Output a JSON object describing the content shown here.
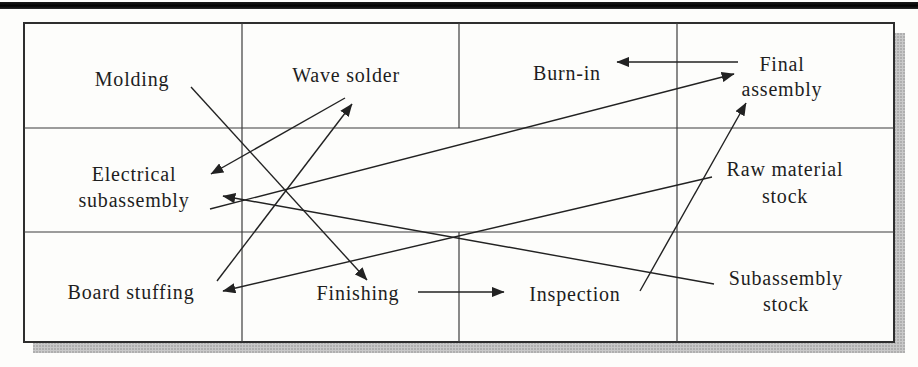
{
  "figure": {
    "kind": "facility-layout-flow-diagram",
    "colors": {
      "ink": "#1e1e1e",
      "grid_line": "#3d3d3d",
      "border": "#2e2e2e",
      "arrow": "#222222",
      "paper": "#fdfdfb",
      "shadow": "#bdbdbd",
      "shadow_dot": "#8e8e8e",
      "top_rule": "#111111"
    },
    "grid": {
      "box": {
        "x": 24,
        "y": 23,
        "w": 870,
        "h": 319
      },
      "h_lines": [
        {
          "y": 128,
          "x1": 24,
          "x2": 894
        },
        {
          "y": 232,
          "x1": 24,
          "x2": 894
        }
      ],
      "v_lines": [
        {
          "x": 242,
          "y1": 23,
          "y2": 342
        },
        {
          "x": 459,
          "y1": 23,
          "y2": 128
        },
        {
          "x": 459,
          "y1": 232,
          "y2": 342
        },
        {
          "x": 677,
          "y1": 23,
          "y2": 342
        }
      ],
      "shadow_rects": [
        {
          "x": 894,
          "y": 33,
          "w": 11,
          "h": 320
        },
        {
          "x": 33,
          "y": 342,
          "w": 872,
          "h": 11
        }
      ]
    },
    "departments": [
      {
        "id": "molding",
        "x": 132,
        "lines": [
          {
            "text": "Molding",
            "y": 86
          }
        ]
      },
      {
        "id": "wave-solder",
        "x": 346,
        "lines": [
          {
            "text": "Wave solder",
            "y": 82
          }
        ]
      },
      {
        "id": "burn-in",
        "x": 567,
        "lines": [
          {
            "text": "Burn-in",
            "y": 80
          }
        ]
      },
      {
        "id": "final-assembly",
        "x": 782,
        "lines": [
          {
            "text": "Final",
            "y": 71
          },
          {
            "text": "assembly",
            "y": 96
          }
        ]
      },
      {
        "id": "electrical-subassembly",
        "x": 134,
        "lines": [
          {
            "text": "Electrical",
            "y": 181
          },
          {
            "text": "subassembly",
            "y": 207
          }
        ]
      },
      {
        "id": "raw-material-stock",
        "x": 785,
        "lines": [
          {
            "text": "Raw material",
            "y": 176
          },
          {
            "text": "stock",
            "y": 203
          }
        ]
      },
      {
        "id": "board-stuffing",
        "x": 131,
        "lines": [
          {
            "text": "Board stuffing",
            "y": 299
          }
        ]
      },
      {
        "id": "finishing",
        "x": 358,
        "lines": [
          {
            "text": "Finishing",
            "y": 300
          }
        ]
      },
      {
        "id": "inspection",
        "x": 575,
        "lines": [
          {
            "text": "Inspection",
            "y": 301
          }
        ]
      },
      {
        "id": "subassembly-stock",
        "x": 786,
        "lines": [
          {
            "text": "Subassembly",
            "y": 285
          },
          {
            "text": "stock",
            "y": 311
          }
        ]
      }
    ],
    "flows": [
      {
        "from": "molding",
        "to": "finishing",
        "x1": 191,
        "y1": 87,
        "x2": 367,
        "y2": 280
      },
      {
        "from": "board-stuffing",
        "to": "wave-solder",
        "x1": 217,
        "y1": 281,
        "x2": 352,
        "y2": 104
      },
      {
        "from": "wave-solder",
        "to": "electrical-subassembly",
        "x1": 345,
        "y1": 98,
        "x2": 211,
        "y2": 174
      },
      {
        "from": "electrical-subassembly",
        "to": "final-assembly",
        "x1": 210,
        "y1": 209,
        "x2": 734,
        "y2": 74
      },
      {
        "from": "final-assembly",
        "to": "burn-in",
        "x1": 738,
        "y1": 62,
        "x2": 617,
        "y2": 62
      },
      {
        "from": "raw-material-stock",
        "to": "board-stuffing",
        "x1": 712,
        "y1": 177,
        "x2": 223,
        "y2": 291
      },
      {
        "from": "subassembly-stock",
        "to": "electrical-subassembly",
        "x1": 714,
        "y1": 284,
        "x2": 223,
        "y2": 196
      },
      {
        "from": "finishing",
        "to": "inspection",
        "x1": 418,
        "y1": 292,
        "x2": 504,
        "y2": 292
      },
      {
        "from": "inspection",
        "to": "final-assembly",
        "x1": 640,
        "y1": 291,
        "x2": 746,
        "y2": 103
      }
    ]
  }
}
